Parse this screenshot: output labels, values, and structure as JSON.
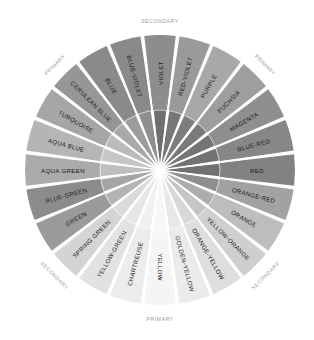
{
  "figure": {
    "type": "color-wheel-diagram",
    "background_color": "#ffffff",
    "segment_count": 24,
    "rendering": "grayscale"
  },
  "geometry": {
    "center_x": 160,
    "center_y": 170,
    "outer_radius": 135,
    "inner_radius": 60,
    "label_radius": 97,
    "ring_label_radius": 149,
    "segment_degrees": 15,
    "gap_degrees": 1.6
  },
  "chart_data": {
    "type": "pie",
    "categories": [
      "VIOLET",
      "RED-VIOLET",
      "PURPLE",
      "FUCHSIA",
      "MAGENTA",
      "BLUE-RED",
      "RED",
      "ORANGE-RED",
      "ORANGE",
      "YELLOW-ORANGE",
      "ORANGE-YELLOW",
      "GOLDEN-YELLOW",
      "YELLOW",
      "CHARTREUSE",
      "YELLOW-GREEN",
      "SPRING GREEN",
      "GREEN",
      "BLUE-GREEN",
      "AQUA GREEN",
      "AQUA BLUE",
      "TURQUOISE",
      "CERULEAN BLUE",
      "BLUE",
      "BLUE-VIOLET"
    ],
    "values": [
      15,
      15,
      15,
      15,
      15,
      15,
      15,
      15,
      15,
      15,
      15,
      15,
      15,
      15,
      15,
      15,
      15,
      15,
      15,
      15,
      15,
      15,
      15,
      15
    ],
    "outer_colors": [
      "#8d8d8d",
      "#9a9a9a",
      "#a8a8a8",
      "#9e9e9e",
      "#8f8f8f",
      "#878787",
      "#828282",
      "#a2a2a2",
      "#bdbdbd",
      "#cfcfcf",
      "#dedede",
      "#ebebeb",
      "#f5f5f5",
      "#ececec",
      "#e2e2e2",
      "#d4d4d4",
      "#9b9b9b",
      "#8c8c8c",
      "#ababab",
      "#b5b5b5",
      "#a6a6a6",
      "#969696",
      "#8a8a8a",
      "#898989"
    ],
    "inner_colors": [
      "#6f6f6f",
      "#777777",
      "#7d7d7d",
      "#7a7a7a",
      "#757575",
      "#727272",
      "#707070",
      "#8e8e8e",
      "#adadad",
      "#c6c6c6",
      "#d8d8d8",
      "#e8e8e8",
      "#f7f7f7",
      "#f0f0f0",
      "#e6e6e6",
      "#dadada",
      "#b4b4b4",
      "#a5a5a5",
      "#bebebe",
      "#c6c6c6",
      "#bbbbbb",
      "#a9a9a9",
      "#9c9c9c",
      "#8e8e8e"
    ],
    "label_orientation": "radial",
    "legend": "none",
    "grid": false
  },
  "segments": [
    {
      "label": "VIOLET",
      "start_angle": -7.5,
      "outer": "#8d8d8d",
      "inner": "#6f6f6f"
    },
    {
      "label": "RED-VIOLET",
      "start_angle": 7.5,
      "outer": "#9a9a9a",
      "inner": "#777777"
    },
    {
      "label": "PURPLE",
      "start_angle": 22.5,
      "outer": "#a8a8a8",
      "inner": "#7d7d7d"
    },
    {
      "label": "FUCHSIA",
      "start_angle": 37.5,
      "outer": "#9e9e9e",
      "inner": "#7a7a7a"
    },
    {
      "label": "MAGENTA",
      "start_angle": 52.5,
      "outer": "#8f8f8f",
      "inner": "#757575"
    },
    {
      "label": "BLUE-RED",
      "start_angle": 67.5,
      "outer": "#878787",
      "inner": "#727272"
    },
    {
      "label": "RED",
      "start_angle": 82.5,
      "outer": "#828282",
      "inner": "#707070"
    },
    {
      "label": "ORANGE-RED",
      "start_angle": 97.5,
      "outer": "#a2a2a2",
      "inner": "#8e8e8e"
    },
    {
      "label": "ORANGE",
      "start_angle": 112.5,
      "outer": "#bdbdbd",
      "inner": "#adadad"
    },
    {
      "label": "YELLOW-ORANGE",
      "start_angle": 127.5,
      "outer": "#cfcfcf",
      "inner": "#c6c6c6"
    },
    {
      "label": "ORANGE-YELLOW",
      "start_angle": 142.5,
      "outer": "#dedede",
      "inner": "#d8d8d8"
    },
    {
      "label": "GOLDEN-YELLOW",
      "start_angle": 157.5,
      "outer": "#ebebeb",
      "inner": "#e8e8e8"
    },
    {
      "label": "YELLOW",
      "start_angle": 172.5,
      "outer": "#f5f5f5",
      "inner": "#f7f7f7"
    },
    {
      "label": "CHARTREUSE",
      "start_angle": 187.5,
      "outer": "#ececec",
      "inner": "#f0f0f0"
    },
    {
      "label": "YELLOW-GREEN",
      "start_angle": 202.5,
      "outer": "#e2e2e2",
      "inner": "#e6e6e6"
    },
    {
      "label": "SPRING GREEN",
      "start_angle": 217.5,
      "outer": "#d4d4d4",
      "inner": "#dadada"
    },
    {
      "label": "GREEN",
      "start_angle": 232.5,
      "outer": "#9b9b9b",
      "inner": "#b4b4b4"
    },
    {
      "label": "BLUE-GREEN",
      "start_angle": 247.5,
      "outer": "#8c8c8c",
      "inner": "#a5a5a5"
    },
    {
      "label": "AQUA GREEN",
      "start_angle": 262.5,
      "outer": "#ababab",
      "inner": "#bebebe"
    },
    {
      "label": "AQUA BLUE",
      "start_angle": 277.5,
      "outer": "#b5b5b5",
      "inner": "#c6c6c6"
    },
    {
      "label": "TURQUOISE",
      "start_angle": 292.5,
      "outer": "#a6a6a6",
      "inner": "#bbbbbb"
    },
    {
      "label": "CERULEAN BLUE",
      "start_angle": 307.5,
      "outer": "#969696",
      "inner": "#a9a9a9"
    },
    {
      "label": "BLUE",
      "start_angle": 322.5,
      "outer": "#8a8a8a",
      "inner": "#9c9c9c"
    },
    {
      "label": "BLUE-VIOLET",
      "start_angle": 337.5,
      "outer": "#898989",
      "inner": "#8e8e8e"
    }
  ],
  "ring_labels": [
    {
      "name": "top",
      "text": "SECONDARY",
      "angle": 0,
      "rotation": 0
    },
    {
      "name": "upper-right",
      "text": "PRIMARY",
      "angle": 45,
      "rotation": 45
    },
    {
      "name": "lower-right",
      "text": "SECONDARY",
      "angle": 135,
      "rotation": -45
    },
    {
      "name": "bottom",
      "text": "PRIMARY",
      "angle": 180,
      "rotation": 0
    },
    {
      "name": "lower-left",
      "text": "SECONDARY",
      "angle": 225,
      "rotation": 45
    },
    {
      "name": "upper-left",
      "text": "PRIMARY",
      "angle": 315,
      "rotation": -45
    }
  ]
}
